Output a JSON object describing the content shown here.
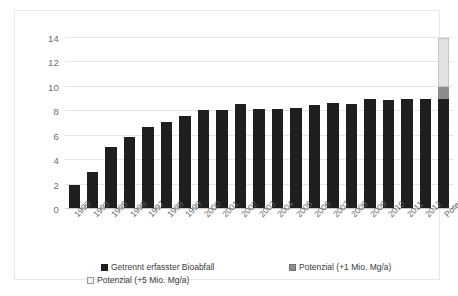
{
  "chart_data": {
    "type": "bar",
    "title": "",
    "subtitle": "",
    "xlabel": "",
    "ylabel": "",
    "ylim": [
      0,
      14
    ],
    "y_ticks": [
      0,
      2,
      4,
      6,
      8,
      10,
      12,
      14
    ],
    "grid": true,
    "stacked": true,
    "legend_position": "bottom",
    "categories": [
      "1990",
      "1993",
      "1995",
      "1996",
      "1997",
      "1998",
      "1999",
      "2000",
      "2001",
      "2002",
      "2003",
      "2004",
      "2005",
      "2006",
      "2007",
      "2008",
      "2009",
      "2010",
      "2011",
      "2012",
      "Potenzial"
    ],
    "series": [
      {
        "name": "Getrennt erfasster Bioabfall",
        "color": "#1f1f1f",
        "values": [
          2.0,
          3.0,
          5.1,
          5.9,
          6.7,
          7.1,
          7.6,
          8.1,
          8.1,
          8.6,
          8.2,
          8.2,
          8.3,
          8.5,
          8.7,
          8.6,
          9.0,
          8.9,
          9.0,
          9.0,
          9.0
        ]
      },
      {
        "name": "Potenzial (+1 Mio. Mg/a)",
        "color": "#8c8c8c",
        "values": [
          0,
          0,
          0,
          0,
          0,
          0,
          0,
          0,
          0,
          0,
          0,
          0,
          0,
          0,
          0,
          0,
          0,
          0,
          0,
          0,
          1.0
        ]
      },
      {
        "name": "Potenzial (+5 Mio. Mg/a)",
        "color": "#e2e2e2",
        "values": [
          0,
          0,
          0,
          0,
          0,
          0,
          0,
          0,
          0,
          0,
          0,
          0,
          0,
          0,
          0,
          0,
          0,
          0,
          0,
          0,
          4.0
        ]
      }
    ],
    "colors": {
      "bar_primary": "#1f1f1f",
      "bar_potenzial_1": "#8c8c8c",
      "bar_potenzial_5": "#e2e2e2",
      "gridline": "#e4e4e4",
      "axis_text": "#6d6d6d",
      "frame": "#e8e8e8",
      "background": "#ffffff"
    }
  },
  "legend": {
    "items": [
      {
        "label": "Getrennt erfasster Bioabfall",
        "color": "#1f1f1f",
        "border": "#1f1f1f"
      },
      {
        "label": "Potenzial (+1 Mio. Mg/a)",
        "color": "#8c8c8c",
        "border": "#6f6f6f"
      },
      {
        "label": "Potenzial (+5 Mio. Mg/a)",
        "color": "#f0f0f0",
        "border": "#9a9a9a"
      }
    ]
  }
}
